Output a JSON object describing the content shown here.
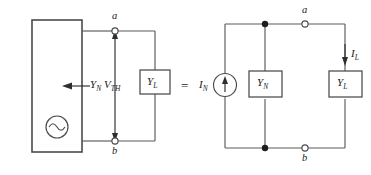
{
  "figure": {
    "relation_symbol": "=",
    "colors": {
      "wire": "#5a5a5a",
      "outline": "#4a4a4a",
      "text": "#1a1a1a",
      "node_dot": "#1d1d1d",
      "background": "#ffffff"
    }
  },
  "left_circuit": {
    "name": "source-network-with-load",
    "network_box": {
      "label": ""
    },
    "source_symbol": "ac-source-icon",
    "admittance_arrow_label": {
      "base": "Y",
      "sub": "N"
    },
    "voltage_label": {
      "base": "V",
      "sub": "TH"
    },
    "load_box_label": {
      "base": "Y",
      "sub": "L"
    },
    "terminals": [
      {
        "id": "a",
        "label": "a",
        "position": "top"
      },
      {
        "id": "b",
        "label": "b",
        "position": "bottom"
      }
    ]
  },
  "right_circuit": {
    "name": "norton-equivalent-with-load",
    "current_source_label": {
      "base": "I",
      "sub": "N"
    },
    "source_symbol": "current-source-icon",
    "norton_admittance_label": {
      "base": "Y",
      "sub": "N"
    },
    "load_box_label": {
      "base": "Y",
      "sub": "L"
    },
    "load_current_label": {
      "base": "I",
      "sub": "L"
    },
    "terminals": [
      {
        "id": "a",
        "label": "a",
        "position": "top"
      },
      {
        "id": "b",
        "label": "b",
        "position": "bottom"
      }
    ],
    "junction_dots": 2
  }
}
